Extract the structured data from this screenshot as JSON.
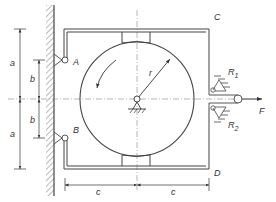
{
  "diagram": {
    "type": "mechanical-brake-schematic",
    "colors": {
      "line": "#444444",
      "centerline": "#888888",
      "label": "#333333",
      "background": "#ffffff"
    },
    "labels": {
      "A": "A",
      "B": "B",
      "C": "C",
      "D": "D",
      "R1": "R",
      "R1_sub": "1",
      "R2": "R",
      "R2_sub": "2",
      "F": "F",
      "r": "r"
    },
    "dimensions": {
      "a_top": "a",
      "a_bottom": "a",
      "b_top": "b",
      "b_bottom": "b",
      "c_left": "c",
      "c_right": "c"
    }
  }
}
